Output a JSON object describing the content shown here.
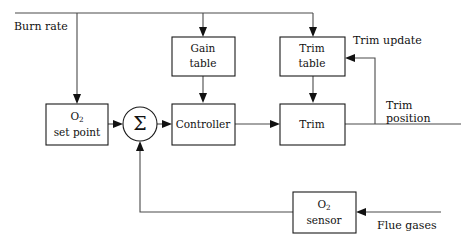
{
  "diagram": {
    "stroke_color": "#4a4a4a",
    "block_border_color": "#1a1a1a",
    "text_color": "#111111",
    "background": "#ffffff"
  },
  "blocks": {
    "o2_setpoint": {
      "line1": "O",
      "sub1": "2",
      "line2": "set point"
    },
    "gain_table": {
      "line1": "Gain",
      "line2": "table"
    },
    "trim_table": {
      "line1": "Trim",
      "line2": "table"
    },
    "controller": {
      "line1": "Controller"
    },
    "trim": {
      "line1": "Trim"
    },
    "o2_sensor": {
      "line1": "O",
      "sub1": "2",
      "line2": "sensor"
    },
    "summing_junction": {
      "symbol": "Σ"
    }
  },
  "labels": {
    "burn_rate": "Burn rate",
    "trim_update": "Trim update",
    "trim_position_line1": "Trim",
    "trim_position_line2": "position",
    "flue_gases": "Flue gases"
  },
  "signals": [
    {
      "name": "burn-rate-to-setpoint",
      "from": "Burn rate",
      "to": "O2 set point"
    },
    {
      "name": "burn-rate-to-gain-table",
      "from": "Burn rate",
      "to": "Gain table"
    },
    {
      "name": "burn-rate-to-trim-table",
      "from": "Burn rate",
      "to": "Trim table"
    },
    {
      "name": "setpoint-to-sum",
      "from": "O2 set point",
      "to": "Summing junction"
    },
    {
      "name": "sum-to-controller",
      "from": "Summing junction",
      "to": "Controller"
    },
    {
      "name": "gain-table-to-controller",
      "from": "Gain table",
      "to": "Controller"
    },
    {
      "name": "controller-to-trim",
      "from": "Controller",
      "to": "Trim"
    },
    {
      "name": "trim-table-to-trim",
      "from": "Trim table",
      "to": "Trim"
    },
    {
      "name": "trim-to-trim-position",
      "from": "Trim",
      "to": "Trim position"
    },
    {
      "name": "trim-position-to-trim-table",
      "from": "Trim position",
      "to": "Trim table"
    },
    {
      "name": "flue-gases-to-sensor",
      "from": "Flue gases",
      "to": "O2 sensor"
    },
    {
      "name": "sensor-to-sum",
      "from": "O2 sensor",
      "to": "Summing junction"
    }
  ]
}
